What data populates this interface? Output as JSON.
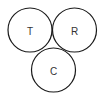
{
  "diagram": {
    "type": "three-circle",
    "stroke_color": "#1a1a1a",
    "label_color": "#333333",
    "circles": [
      {
        "id": "T",
        "label": "T",
        "cx": 30,
        "cy": 30,
        "r": 22
      },
      {
        "id": "R",
        "label": "R",
        "cx": 74.5,
        "cy": 30,
        "r": 22
      },
      {
        "id": "C",
        "label": "C",
        "cx": 53.5,
        "cy": 70,
        "r": 22
      }
    ]
  }
}
